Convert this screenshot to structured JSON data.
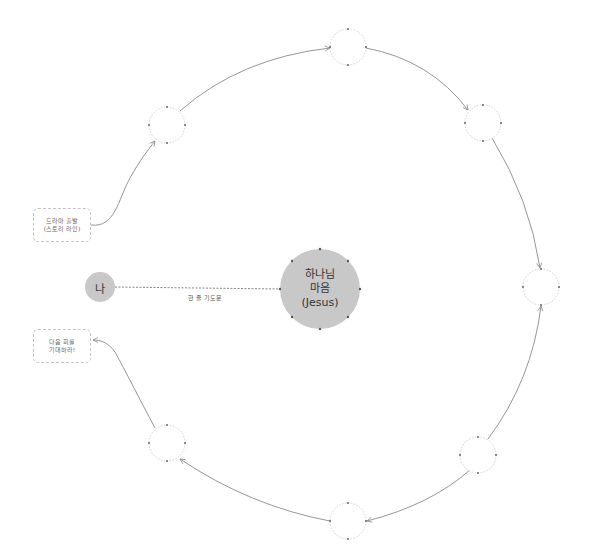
{
  "diagram": {
    "colors": {
      "center_fill": "#c8c8c8",
      "me_fill": "#c8c8c8",
      "stroke": "#888888",
      "node_border": "#c4c4c4"
    },
    "center": {
      "line1": "하나님",
      "line2": "마음",
      "line3": "(Jesus)"
    },
    "me": {
      "label": "나"
    },
    "prayer_edge": {
      "label": "한 줄 기도문"
    },
    "start_box": {
      "line1": "드라마 출발",
      "line2": "(스토리 라인)"
    },
    "end_box": {
      "line1": "다음 회를",
      "line2": "기대하라!"
    },
    "ring_nodes": [
      {
        "id": "top",
        "label": ""
      },
      {
        "id": "top-right",
        "label": ""
      },
      {
        "id": "right",
        "label": ""
      },
      {
        "id": "bottom-right",
        "label": ""
      },
      {
        "id": "bottom",
        "label": ""
      },
      {
        "id": "bottom-left",
        "label": ""
      },
      {
        "id": "top-left",
        "label": ""
      }
    ]
  }
}
